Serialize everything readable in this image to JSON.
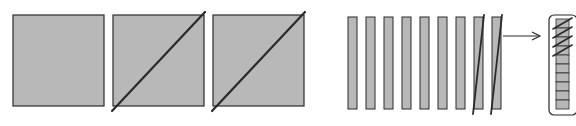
{
  "diagram": {
    "colors": {
      "fill": "#b8b8b8",
      "stroke": "#2a2a2a",
      "background": "#ffffff"
    },
    "squares": [
      {
        "slashed": false
      },
      {
        "slashed": true
      },
      {
        "slashed": true
      }
    ],
    "strips": [
      {
        "slashed": false
      },
      {
        "slashed": false
      },
      {
        "slashed": false
      },
      {
        "slashed": false
      },
      {
        "slashed": false
      },
      {
        "slashed": false
      },
      {
        "slashed": false
      },
      {
        "slashed": true
      },
      {
        "slashed": true
      }
    ],
    "arrow": {
      "direction": "right"
    },
    "stack": {
      "total_cells": 10,
      "slashed_cells": 4
    }
  }
}
